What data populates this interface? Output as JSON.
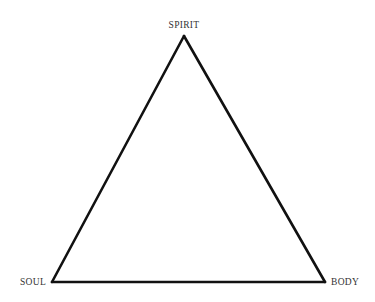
{
  "diagram": {
    "type": "triangle",
    "stroke_color": "#111111",
    "label_color": "#333333",
    "vertices": {
      "top": {
        "label": "SPIRIT"
      },
      "bottom_left": {
        "label": "SOUL"
      },
      "bottom_right": {
        "label": "BODY"
      }
    },
    "edges": [
      {
        "from": "top",
        "to": "bottom_left"
      },
      {
        "from": "top",
        "to": "bottom_right"
      },
      {
        "from": "bottom_left",
        "to": "bottom_right"
      }
    ]
  }
}
